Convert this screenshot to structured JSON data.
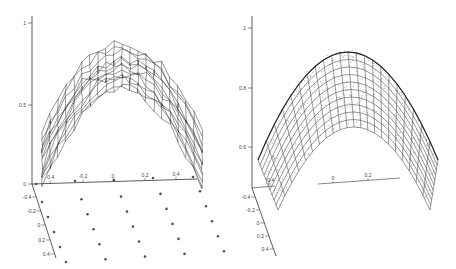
{
  "chart_data": [
    {
      "type": "surface",
      "title": "",
      "description": "3D wireframe surface (noisy, reconstructed) over sparse sample grid",
      "zlabel": "",
      "z_ticks": [
        "0",
        "0.5",
        "1"
      ],
      "x_ticks": [
        "-0.4",
        "-0.2",
        "0",
        "0.2",
        "0.4"
      ],
      "y_ticks": [
        "-0.4",
        "-0.2",
        "0",
        "0.2",
        "0.4"
      ],
      "zlim": [
        0,
        1
      ],
      "xlim": [
        -0.5,
        0.5
      ],
      "ylim": [
        -0.5,
        0.5
      ],
      "grid": false,
      "surface": "z ≈ 0.9 - 1.6*x^2 with noise (dome-shaped, peak ~0.85)",
      "sample_points_grid": {
        "rows": 5,
        "cols": 5,
        "note": "25 sample points on the base plane plus 5 along the x-axis"
      }
    },
    {
      "type": "surface",
      "title": "",
      "description": "3D wireframe surface (smooth fit) with scattered noisy data points",
      "z_ticks": [
        "0.6",
        "0.8",
        "1"
      ],
      "x_ticks": [
        "-0.4",
        "0",
        "0.2"
      ],
      "y_ticks": [
        "-0.4",
        "-0.2",
        "0",
        "0.2",
        "0.4"
      ],
      "zlim": [
        0.5,
        1
      ],
      "grid": false,
      "surface": "z ≈ 0.9 - 3*x^2 (smooth parabolic arch, peak ~0.9)",
      "scatter": "dense noisy points around the surface"
    }
  ],
  "left": {
    "z_axis": {
      "ticks": [
        {
          "label": "1",
          "y": 23
        },
        {
          "label": "0.5",
          "y": 105
        },
        {
          "label": "0",
          "y": 184
        }
      ]
    },
    "x_axis": {
      "ticks": [
        {
          "label": "-0.4",
          "x": 50
        },
        {
          "label": "-0.2",
          "x": 83
        },
        {
          "label": "0",
          "x": 113
        },
        {
          "label": "0.2",
          "x": 145
        },
        {
          "label": "0.4",
          "x": 176
        }
      ]
    },
    "y_axis": {
      "ticks": [
        {
          "label": "-0.4",
          "y": 197
        },
        {
          "label": "-0.2",
          "y": 211
        },
        {
          "label": "0",
          "y": 225
        },
        {
          "label": "0.2",
          "y": 240
        },
        {
          "label": "0.4",
          "y": 254
        }
      ]
    }
  },
  "right": {
    "z_axis": {
      "ticks": [
        {
          "label": "1",
          "y": 28
        },
        {
          "label": "0.8",
          "y": 88
        },
        {
          "label": "0.6",
          "y": 147
        }
      ]
    },
    "x_axis": {
      "ticks": [
        {
          "label": "-0.4",
          "x": 270
        },
        {
          "label": "0",
          "x": 333
        },
        {
          "label": "0.2",
          "x": 368
        }
      ]
    },
    "y_axis": {
      "ticks": [
        {
          "label": "-0.4",
          "y": 197
        },
        {
          "label": "-0.2",
          "y": 210
        },
        {
          "label": "0",
          "y": 223
        },
        {
          "label": "0.2",
          "y": 236
        },
        {
          "label": "0.4",
          "y": 249
        }
      ]
    }
  }
}
